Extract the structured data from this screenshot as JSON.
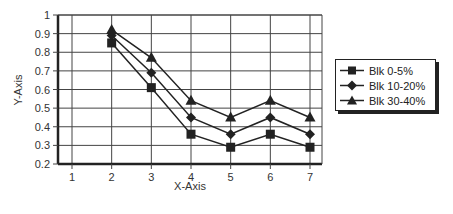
{
  "chart_data": {
    "type": "line",
    "title": "",
    "xlabel": "X-Axis",
    "ylabel": "Y-Axis",
    "x": [
      2,
      3,
      4,
      5,
      6,
      7
    ],
    "xticks": [
      1,
      2,
      3,
      4,
      5,
      6,
      7
    ],
    "yticks": [
      0.2,
      0.3,
      0.4,
      0.5,
      0.6,
      0.7,
      0.8,
      0.9,
      1
    ],
    "xlim": [
      0.6,
      7.3
    ],
    "ylim": [
      0.2,
      1
    ],
    "grid": true,
    "legend_position": "right",
    "series": [
      {
        "name": "Blk 0-5%",
        "marker": "square",
        "values": [
          0.85,
          0.61,
          0.36,
          0.29,
          0.36,
          0.29
        ]
      },
      {
        "name": "Blk 10-20%",
        "marker": "diamond",
        "values": [
          0.89,
          0.69,
          0.45,
          0.36,
          0.45,
          0.36
        ]
      },
      {
        "name": "Blk 30-40%",
        "marker": "triangle",
        "values": [
          0.92,
          0.77,
          0.54,
          0.45,
          0.54,
          0.45
        ]
      }
    ]
  },
  "legend": {
    "items": [
      {
        "label": "Blk 0-5%",
        "icon": "square-marker-icon"
      },
      {
        "label": "Blk 10-20%",
        "icon": "diamond-marker-icon"
      },
      {
        "label": "Blk 30-40%",
        "icon": "triangle-marker-icon"
      }
    ]
  },
  "colors": {
    "line": "#222222",
    "grid": "#444444",
    "background": "#ffffff"
  }
}
